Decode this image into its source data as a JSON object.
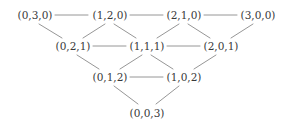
{
  "diagram": {
    "type": "hasse-diagram",
    "title": "",
    "background_color": "#ffffff",
    "text_color": "#38383a",
    "edge_color": "#8a8a8a",
    "levels": [
      {
        "index": 0,
        "nodes": [
          {
            "id": "n030",
            "label": "(0,3,0)",
            "x": 35,
            "y": 15
          },
          {
            "id": "n120",
            "label": "(1,2,0)",
            "x": 110,
            "y": 15
          },
          {
            "id": "n210",
            "label": "(2,1,0)",
            "x": 184,
            "y": 15
          },
          {
            "id": "n300",
            "label": "(3,0,0)",
            "x": 258,
            "y": 15
          }
        ]
      },
      {
        "index": 1,
        "nodes": [
          {
            "id": "n021",
            "label": "(0,2,1)",
            "x": 73,
            "y": 46
          },
          {
            "id": "n111",
            "label": "(1,1,1)",
            "x": 147,
            "y": 46
          },
          {
            "id": "n201",
            "label": "(2,0,1)",
            "x": 221,
            "y": 46
          }
        ]
      },
      {
        "index": 2,
        "nodes": [
          {
            "id": "n012",
            "label": "(0,1,2)",
            "x": 110,
            "y": 77
          },
          {
            "id": "n102",
            "label": "(1,0,2)",
            "x": 184,
            "y": 77
          }
        ]
      },
      {
        "index": 3,
        "nodes": [
          {
            "id": "n003",
            "label": "(0,0,3)",
            "x": 147,
            "y": 113
          }
        ]
      }
    ],
    "edges": [
      {
        "id": "e-030-120",
        "from": "n030",
        "to": "n120",
        "kind": "horizontal",
        "x1": 55,
        "y1": 15,
        "x2": 88,
        "y2": 15
      },
      {
        "id": "e-120-210",
        "from": "n120",
        "to": "n210",
        "kind": "horizontal",
        "x1": 130,
        "y1": 15,
        "x2": 163,
        "y2": 15
      },
      {
        "id": "e-210-300",
        "from": "n210",
        "to": "n300",
        "kind": "horizontal",
        "x1": 204,
        "y1": 15,
        "x2": 237,
        "y2": 15
      },
      {
        "id": "e-030-021",
        "from": "n030",
        "to": "n021",
        "kind": "diagonal",
        "x1": 39,
        "y1": 24,
        "x2": 62,
        "y2": 38
      },
      {
        "id": "e-120-021",
        "from": "n120",
        "to": "n021",
        "kind": "diagonal",
        "x1": 105,
        "y1": 24,
        "x2": 83,
        "y2": 38
      },
      {
        "id": "e-120-111",
        "from": "n120",
        "to": "n111",
        "kind": "diagonal",
        "x1": 114,
        "y1": 24,
        "x2": 136,
        "y2": 38
      },
      {
        "id": "e-210-111",
        "from": "n210",
        "to": "n111",
        "kind": "diagonal",
        "x1": 179,
        "y1": 24,
        "x2": 157,
        "y2": 38
      },
      {
        "id": "e-210-201",
        "from": "n210",
        "to": "n201",
        "kind": "diagonal",
        "x1": 188,
        "y1": 24,
        "x2": 210,
        "y2": 38
      },
      {
        "id": "e-300-201",
        "from": "n300",
        "to": "n201",
        "kind": "diagonal",
        "x1": 253,
        "y1": 24,
        "x2": 231,
        "y2": 38
      },
      {
        "id": "e-021-111",
        "from": "n021",
        "to": "n111",
        "kind": "horizontal",
        "x1": 93,
        "y1": 46,
        "x2": 126,
        "y2": 46
      },
      {
        "id": "e-111-201",
        "from": "n111",
        "to": "n201",
        "kind": "horizontal",
        "x1": 167,
        "y1": 46,
        "x2": 200,
        "y2": 46
      },
      {
        "id": "e-021-012",
        "from": "n021",
        "to": "n012",
        "kind": "diagonal",
        "x1": 77,
        "y1": 55,
        "x2": 99,
        "y2": 69
      },
      {
        "id": "e-111-012",
        "from": "n111",
        "to": "n012",
        "kind": "diagonal",
        "x1": 142,
        "y1": 55,
        "x2": 120,
        "y2": 69
      },
      {
        "id": "e-111-102",
        "from": "n111",
        "to": "n102",
        "kind": "diagonal",
        "x1": 151,
        "y1": 55,
        "x2": 173,
        "y2": 69
      },
      {
        "id": "e-201-102",
        "from": "n201",
        "to": "n102",
        "kind": "diagonal",
        "x1": 216,
        "y1": 55,
        "x2": 194,
        "y2": 69
      },
      {
        "id": "e-012-102",
        "from": "n012",
        "to": "n102",
        "kind": "horizontal",
        "x1": 130,
        "y1": 77,
        "x2": 163,
        "y2": 77
      },
      {
        "id": "e-012-003",
        "from": "n012",
        "to": "n003",
        "kind": "diagonal",
        "x1": 114,
        "y1": 86,
        "x2": 138,
        "y2": 104
      },
      {
        "id": "e-102-003",
        "from": "n102",
        "to": "n003",
        "kind": "diagonal",
        "x1": 179,
        "y1": 86,
        "x2": 156,
        "y2": 104
      }
    ]
  }
}
